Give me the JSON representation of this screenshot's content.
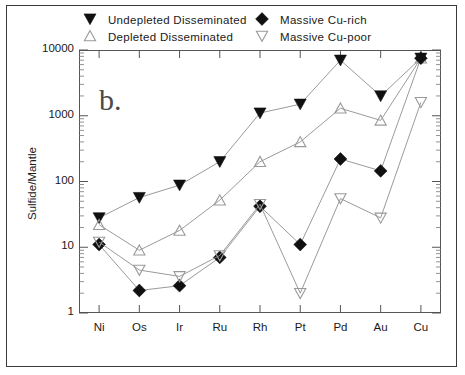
{
  "panel": {
    "label": "b."
  },
  "axes": {
    "ylabel": "Sulfide/Mantle",
    "xlabel": "",
    "ytick_labels": [
      "10000",
      "1000",
      "100",
      "10",
      "1"
    ],
    "ytick_values": [
      10000,
      1000,
      100,
      10,
      1
    ],
    "ylim": [
      1,
      10000
    ],
    "yscale": "log",
    "xtick_labels": [
      "Ni",
      "Os",
      "Ir",
      "Ru",
      "Rh",
      "Pt",
      "Pd",
      "Au",
      "Cu"
    ]
  },
  "legend": {
    "position": "top",
    "entries": [
      {
        "label": "Undepleted  Disseminated",
        "marker": "filled-triangle-down-icon",
        "color": "#101010"
      },
      {
        "label": "Depleted  Disseminated",
        "marker": "open-triangle-up-icon",
        "color": "#9a9a9a"
      },
      {
        "label": "Massive  Cu-rich",
        "marker": "filled-diamond-icon",
        "color": "#101010"
      },
      {
        "label": "Massive  Cu-poor",
        "marker": "open-triangle-down-icon",
        "color": "#9a9a9a"
      }
    ]
  },
  "chart_data": {
    "type": "line",
    "title": "",
    "xlabel": "",
    "ylabel": "Sulfide/Mantle",
    "yscale": "log",
    "ylim": [
      1,
      10000
    ],
    "grid": false,
    "legend_position": "top",
    "categories": [
      "Ni",
      "Os",
      "Ir",
      "Ru",
      "Rh",
      "Pt",
      "Pd",
      "Au",
      "Cu"
    ],
    "series": [
      {
        "name": "Undepleted  Disseminated",
        "marker": "filled-triangle-down-icon",
        "color": "#101010",
        "values": [
          28,
          57,
          88,
          200,
          1100,
          1500,
          7000,
          2000,
          7500
        ]
      },
      {
        "name": "Depleted  Disseminated",
        "marker": "open-triangle-up-icon",
        "color": "#9a9a9a",
        "values": [
          22,
          9,
          18,
          52,
          200,
          400,
          1300,
          850,
          7500
        ]
      },
      {
        "name": "Massive  Cu-rich",
        "marker": "filled-diamond-icon",
        "color": "#101010",
        "values": [
          11,
          2.2,
          2.6,
          7,
          42,
          11,
          220,
          145,
          7500
        ]
      },
      {
        "name": "Massive  Cu-poor",
        "marker": "open-triangle-down-icon",
        "color": "#9a9a9a",
        "values": [
          12,
          4.5,
          3.6,
          7.5,
          45,
          2.0,
          55,
          28,
          1600
        ]
      }
    ]
  }
}
